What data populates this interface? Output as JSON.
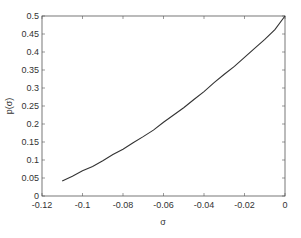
{
  "chart_data": {
    "type": "line",
    "title": "",
    "xlabel": "σ",
    "ylabel": "p(σ)",
    "xlim": [
      -0.12,
      0
    ],
    "ylim": [
      0,
      0.5
    ],
    "grid": false,
    "legend": null,
    "x_ticks": [
      "-0.12",
      "-0.1",
      "-0.08",
      "-0.06",
      "-0.04",
      "-0.02",
      "0"
    ],
    "y_ticks": [
      "0",
      "0.05",
      "0.1",
      "0.15",
      "0.2",
      "0.25",
      "0.3",
      "0.35",
      "0.4",
      "0.45",
      "0.5"
    ],
    "series": [
      {
        "name": "p(sigma)",
        "x": [
          -0.11,
          -0.105,
          -0.1,
          -0.095,
          -0.09,
          -0.085,
          -0.08,
          -0.075,
          -0.07,
          -0.065,
          -0.06,
          -0.055,
          -0.05,
          -0.045,
          -0.04,
          -0.035,
          -0.03,
          -0.025,
          -0.02,
          -0.015,
          -0.01,
          -0.005,
          0
        ],
        "y": [
          0.042,
          0.055,
          0.07,
          0.082,
          0.098,
          0.115,
          0.13,
          0.148,
          0.165,
          0.183,
          0.205,
          0.225,
          0.245,
          0.268,
          0.29,
          0.315,
          0.338,
          0.36,
          0.385,
          0.41,
          0.435,
          0.462,
          0.5
        ]
      }
    ]
  }
}
